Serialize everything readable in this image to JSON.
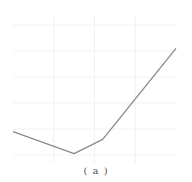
{
  "caption": "( a )",
  "colors": {
    "line": "#8a8a8a",
    "grid": "#f1f1f1",
    "background": "#ffffff"
  },
  "chart_data": {
    "type": "line",
    "title": "",
    "xlabel": "",
    "ylabel": "",
    "caption": "(a)",
    "grid": true,
    "legend": null,
    "xlim": [
      0,
      4
    ],
    "ylim": [
      0,
      5
    ],
    "x_gridlines": [
      0,
      1,
      2,
      3,
      4
    ],
    "y_gridlines": [
      0,
      1,
      2,
      3,
      4,
      5
    ],
    "series": [
      {
        "name": "curve",
        "x": [
          0.0,
          1.5,
          2.2,
          4.0
        ],
        "y": [
          0.9,
          0.05,
          0.6,
          4.1
        ]
      }
    ],
    "pixel_frame": {
      "x0": 13,
      "x1": 176,
      "y_top": 25,
      "y_bottom": 155
    }
  }
}
